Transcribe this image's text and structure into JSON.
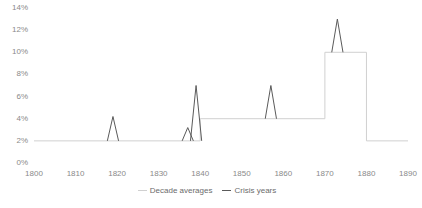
{
  "chart_data": {
    "type": "line",
    "title": "",
    "subtitle": "",
    "xlabel": "",
    "ylabel": "",
    "xlim": [
      1800,
      1890
    ],
    "ylim": [
      0,
      14
    ],
    "grid": false,
    "legend_position": "bottom-center",
    "x_ticks": [
      1800,
      1810,
      1820,
      1830,
      1840,
      1850,
      1860,
      1870,
      1880,
      1890
    ],
    "x_tick_labels": [
      "1800",
      "1810",
      "1820",
      "1830",
      "1840",
      "1850",
      "1860",
      "1870",
      "1880",
      "1890"
    ],
    "y_ticks": [
      0,
      2,
      4,
      6,
      8,
      10,
      12,
      14
    ],
    "y_tick_labels": [
      "0%",
      "2%",
      "4%",
      "6%",
      "8%",
      "10%",
      "12%",
      "14%"
    ],
    "series": [
      {
        "name": "Decade averages",
        "type": "step",
        "color": "#d0d0d0",
        "points": [
          {
            "x": 1800,
            "y": 2
          },
          {
            "x": 1840,
            "y": 2
          },
          {
            "x": 1840,
            "y": 4
          },
          {
            "x": 1870,
            "y": 4
          },
          {
            "x": 1870,
            "y": 10
          },
          {
            "x": 1880,
            "y": 10
          },
          {
            "x": 1880,
            "y": 2
          },
          {
            "x": 1890,
            "y": 2
          }
        ]
      },
      {
        "name": "Crisis years",
        "type": "spikes",
        "color": "#5a5a5a",
        "spikes": [
          {
            "x": 1819,
            "y": 4.2,
            "base": 2
          },
          {
            "x": 1837,
            "y": 3.2,
            "base": 2
          },
          {
            "x": 1839,
            "y": 7.0,
            "base": 2
          },
          {
            "x": 1857,
            "y": 7.0,
            "base": 4
          },
          {
            "x": 1873,
            "y": 13.0,
            "base": 10
          }
        ]
      }
    ]
  },
  "legend": {
    "items": [
      {
        "label": "Decade averages",
        "color": "#d0d0d0"
      },
      {
        "label": "Crisis years",
        "color": "#5a5a5a"
      }
    ]
  },
  "caption": {
    "text": ""
  }
}
